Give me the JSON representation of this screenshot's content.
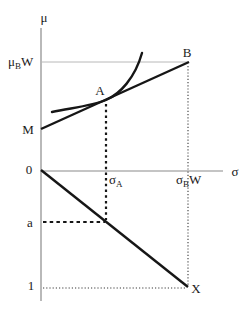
{
  "figure": {
    "colors": {
      "background": "#ffffff",
      "curve_line": "#161616",
      "axis": "#8a8a8a",
      "thin_level_line": "#b8b8b8",
      "dotted_guide": "#161616",
      "fine_dotted_guide": "#3a3a3a"
    },
    "labels": {
      "mu_axis": "μ",
      "sigma_axis": "σ",
      "mu_b_w": {
        "base": "μ",
        "sub": "B",
        "suffix": "W"
      },
      "sigma_a": {
        "base": "σ",
        "sub": "A",
        "suffix": ""
      },
      "sigma_b_w": {
        "base": "σ",
        "sub": "B",
        "suffix": "W"
      },
      "point_b": "B",
      "point_a": "A",
      "point_m": "M",
      "point_x": "X",
      "origin": "0",
      "level_a": "a",
      "level_one": "1"
    }
  }
}
